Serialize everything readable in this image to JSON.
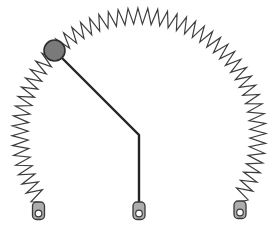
{
  "canvas": {
    "width": 274,
    "height": 226,
    "background": "#ffffff"
  },
  "diagram": {
    "kind": "physics-spring-pendulum-diagram",
    "spring": {
      "center": {
        "x": 139,
        "y": 135
      },
      "radius": 119,
      "amplitude": 8,
      "start_angle_deg": -33,
      "end_angle_deg": 214,
      "coils": 55,
      "color": "#3d3d3d",
      "stroke_width": 1.2,
      "end_right": {
        "x": 240,
        "y": 202
      },
      "end_left": {
        "x": 38.5,
        "y": 202
      }
    },
    "rod": {
      "points": [
        [
          54.5,
          50.5
        ],
        [
          139,
          135
        ],
        [
          139,
          203
        ]
      ],
      "color": "#252525",
      "stroke_width": 2.4
    },
    "ball": {
      "cx": 54.5,
      "cy": 50.5,
      "r": 10.5,
      "fill": "#7a7a7a",
      "stroke": "#2f2f2f",
      "stroke_width": 1.6
    },
    "anchors": [
      {
        "id": "left",
        "cx": 38.5,
        "top": 202
      },
      {
        "id": "center",
        "cx": 139,
        "top": 202
      },
      {
        "id": "right",
        "cx": 240,
        "top": 201
      }
    ],
    "anchor_style": {
      "width": 12,
      "height": 17.5,
      "rx": 4,
      "fill": "#adadad",
      "stroke": "#3a3a3a",
      "stroke_width": 1.3,
      "hole_offset_y": 11.5,
      "hole_r": 3.3,
      "hole_fill": "#ffffff",
      "hole_stroke": "#3a3a3a",
      "hole_stroke_width": 1.2
    }
  }
}
